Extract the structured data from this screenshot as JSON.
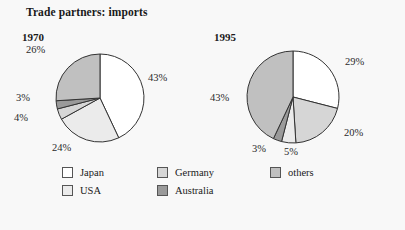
{
  "title": "Trade partners: imports",
  "legend": {
    "items": [
      {
        "label": "Japan",
        "color": "#ffffff",
        "key": "japan"
      },
      {
        "label": "USA",
        "color": "#ebebeb",
        "key": "usa"
      },
      {
        "label": "Germany",
        "color": "#d6d6d6",
        "key": "germany"
      },
      {
        "label": "Australia",
        "color": "#9a9a9a",
        "key": "australia"
      },
      {
        "label": "others",
        "color": "#c0c0c0",
        "key": "others"
      }
    ]
  },
  "charts": [
    {
      "year": "1970",
      "labels": [
        "43%",
        "24%",
        "4%",
        "3%",
        "26%"
      ]
    },
    {
      "year": "1995",
      "labels": [
        "29%",
        "20%",
        "5%",
        "3%",
        "43%"
      ]
    }
  ],
  "chart_data": [
    {
      "type": "pie",
      "title": "1970",
      "categories": [
        "Japan",
        "USA",
        "Germany",
        "Australia",
        "others"
      ],
      "values": [
        43,
        24,
        4,
        3,
        26
      ],
      "labels": [
        "43%",
        "24%",
        "4%",
        "3%",
        "26%"
      ],
      "colors": [
        "#ffffff",
        "#ebebeb",
        "#d6d6d6",
        "#9a9a9a",
        "#c0c0c0"
      ],
      "start_angle_deg": 0,
      "direction": "clockwise",
      "legend_position": "bottom"
    },
    {
      "type": "pie",
      "title": "1995",
      "categories": [
        "Japan",
        "Germany",
        "USA",
        "Australia",
        "others"
      ],
      "values": [
        29,
        20,
        5,
        3,
        43
      ],
      "labels": [
        "29%",
        "20%",
        "5%",
        "3%",
        "43%"
      ],
      "colors": [
        "#ffffff",
        "#d6d6d6",
        "#ebebeb",
        "#9a9a9a",
        "#c0c0c0"
      ],
      "start_angle_deg": 0,
      "direction": "clockwise",
      "legend_position": "bottom"
    }
  ],
  "geometry": {
    "pies": [
      {
        "cx": 100,
        "cy": 98,
        "r": 44
      },
      {
        "cx": 293,
        "cy": 97,
        "r": 46
      }
    ],
    "label_positions": [
      [
        {
          "x": 148,
          "y": 72
        },
        {
          "x": 52,
          "y": 142
        },
        {
          "x": 14,
          "y": 112
        },
        {
          "x": 16,
          "y": 92
        },
        {
          "x": 26,
          "y": 44
        }
      ],
      [
        {
          "x": 345,
          "y": 56
        },
        {
          "x": 344,
          "y": 127
        },
        {
          "x": 284,
          "y": 146
        },
        {
          "x": 252,
          "y": 143
        },
        {
          "x": 210,
          "y": 92
        }
      ]
    ]
  }
}
